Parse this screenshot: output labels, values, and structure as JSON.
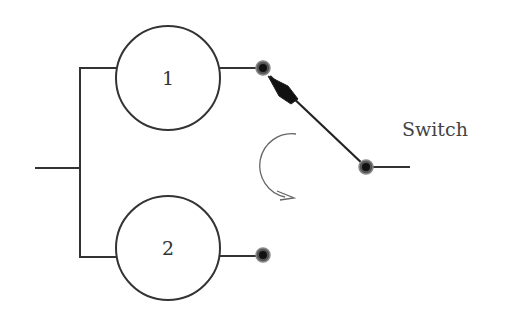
{
  "diagram": {
    "type": "switch-circuit",
    "nodes": [
      {
        "id": "1",
        "label": "1",
        "cx": 168,
        "cy": 78,
        "r": 52
      },
      {
        "id": "2",
        "label": "2",
        "cx": 168,
        "cy": 248,
        "r": 52
      }
    ],
    "contacts": [
      {
        "id": "contact-1",
        "x": 263,
        "y": 68
      },
      {
        "id": "contact-2",
        "x": 263,
        "y": 255
      },
      {
        "id": "pivot",
        "x": 366,
        "y": 167
      }
    ],
    "switch": {
      "label": "Switch",
      "position": "contact-1",
      "rotation_direction": "counterclockwise"
    },
    "colors": {
      "line": "#333333",
      "contact": "#111111",
      "arrow": "#666666",
      "background": "#ffffff"
    }
  }
}
